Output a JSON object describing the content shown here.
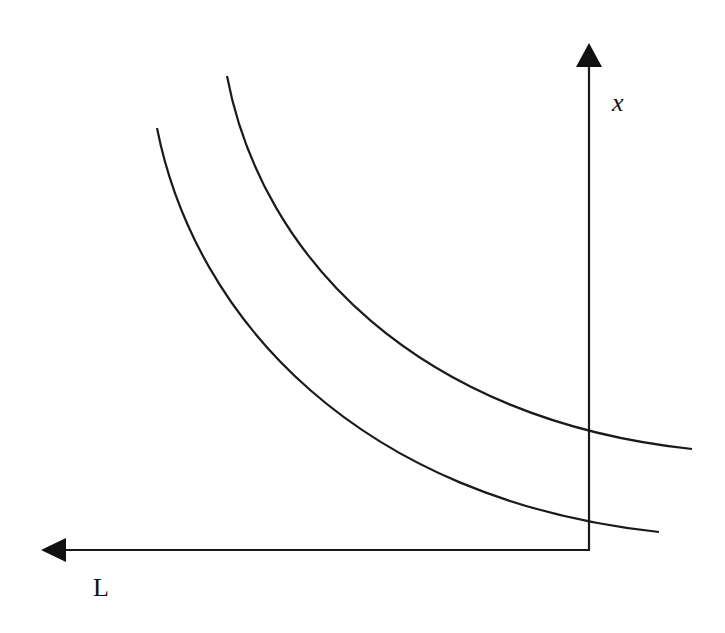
{
  "diagram": {
    "axes": {
      "vertical_label": "x",
      "horizontal_label": "L",
      "color": "#1a1a1a"
    },
    "curves": [
      {
        "name": "isoquant-outer",
        "d": "M 227 76 C 262 260, 420 420, 692 449"
      },
      {
        "name": "isoquant-inner",
        "d": "M 157 128 C 195 320, 360 500, 659 532"
      }
    ]
  }
}
